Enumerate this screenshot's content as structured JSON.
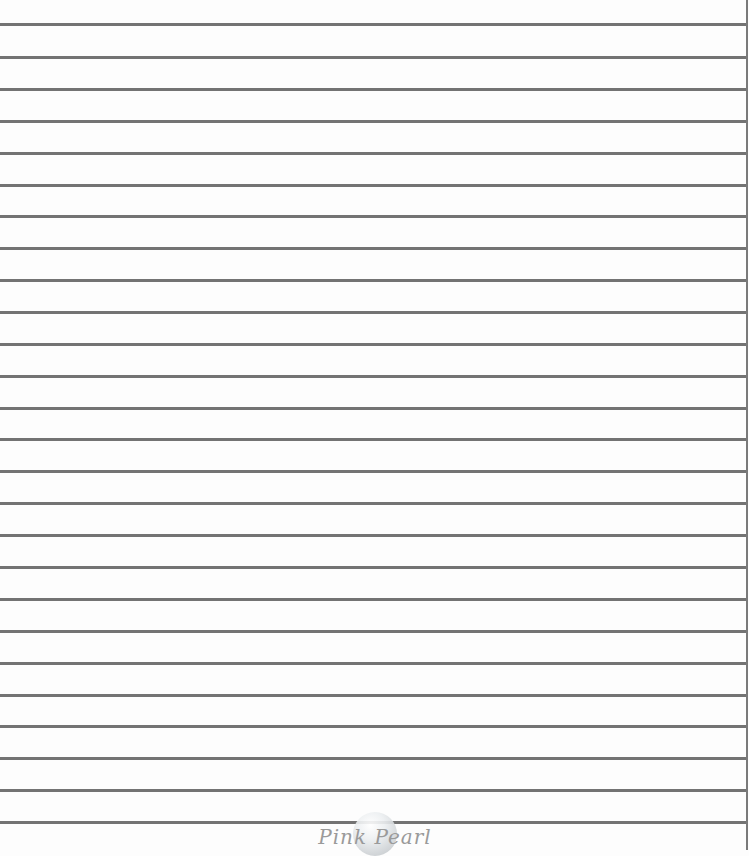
{
  "page": {
    "type": "lined-notebook-paper",
    "line_color": "#737373",
    "background_color": "#fdfdfd",
    "rule_count": 26,
    "rule_positions_y": [
      24,
      57,
      89,
      121,
      153,
      185,
      216,
      248,
      280,
      312,
      344,
      376,
      408,
      439,
      471,
      503,
      535,
      567,
      599,
      631,
      663,
      695,
      726,
      758,
      790,
      822
    ]
  },
  "logo": {
    "text": "Pink Pearl",
    "icon": "pearl-icon"
  }
}
